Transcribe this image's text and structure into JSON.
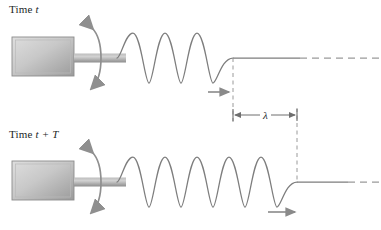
{
  "figure": {
    "width": 381,
    "height": 230,
    "background": "#ffffff"
  },
  "colors": {
    "stroke": "#7a7a7a",
    "wave": "#7d7d7d",
    "dashed": "#9a9a9a",
    "text": "#221f1f",
    "box_fill_light": "#d8d8d8",
    "box_fill_dark": "#9d9d9d",
    "box_border": "#8c8c8c",
    "rod_light": "#cfcfcf",
    "rod_dark": "#8f8f8f",
    "arrow": "#8a8a8a"
  },
  "panels": [
    {
      "id": "top",
      "label_prefix": "Time ",
      "label_var": "t",
      "label_suffix": "",
      "label_full": "Time t",
      "axis_y": 58,
      "source_x": 117,
      "wavefront_x": 233,
      "cycles": 2.25,
      "wavelength_px": 64,
      "amplitude_px": 25,
      "flat_solid_end_x": 300,
      "flat_dashed_end_x": 381,
      "propagation_arrow": {
        "x1": 208,
        "x2": 231,
        "y": 92,
        "direction": "right"
      }
    },
    {
      "id": "bottom",
      "label_prefix": "Time ",
      "label_var": "t",
      "label_suffix": " + T",
      "label_full": "Time t + T",
      "axis_y": 182,
      "source_x": 117,
      "wavefront_x": 297,
      "cycles": 3.25,
      "wavelength_px": 64,
      "amplitude_px": 25,
      "flat_solid_end_x": 348,
      "flat_dashed_end_x": 381,
      "propagation_arrow": {
        "x1": 268,
        "x2": 297,
        "y": 212,
        "direction": "right"
      }
    }
  ],
  "oscillator": {
    "box": {
      "x": 12,
      "y": 37,
      "width": 62,
      "height": 39
    },
    "rod": {
      "x": 74,
      "y": 53,
      "width": 52,
      "height": 9
    },
    "oscillation_arrow": {
      "description": "double-headed curved arrow showing transverse oscillation of the source",
      "top_head": "up",
      "bottom_head": "down"
    }
  },
  "wavelength_marker": {
    "symbol": "λ",
    "label": "λ",
    "meaning": "wavelength",
    "dimension_line_y": 115,
    "left_x": 233,
    "right_x": 297,
    "left_tick_y1": 108,
    "left_tick_y2": 122,
    "right_tick_y1": 108,
    "right_tick_y2": 122,
    "dashed_guide_top": {
      "x": 233,
      "y1": 58,
      "y2": 115
    },
    "dashed_guide_bottom": {
      "x": 297,
      "y1": 115,
      "y2": 182
    }
  },
  "annotations": {
    "propagation_direction": "right",
    "note": "In one period T the wave advances exactly one wavelength λ."
  }
}
